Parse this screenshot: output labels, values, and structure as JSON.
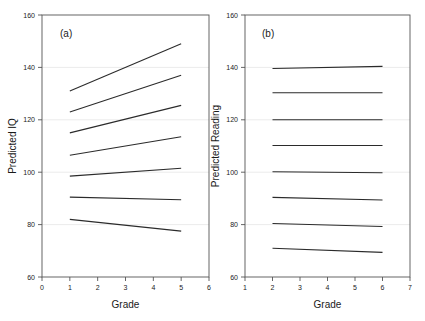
{
  "figure": {
    "background_color": "#ffffff",
    "line_color": "#2b2b2b",
    "axis_color": "#555555",
    "grid_color": "#e2e2e2"
  },
  "chart_data": [
    {
      "type": "line",
      "panel_label": "(a)",
      "title": "",
      "xlabel": "Grade",
      "ylabel": "Predicted IQ",
      "xlim": [
        0,
        6
      ],
      "ylim": [
        60,
        160
      ],
      "xticks": [
        0,
        1,
        2,
        3,
        4,
        5,
        6
      ],
      "xtick_labels": [
        "0",
        "1",
        "2",
        "3",
        "4",
        "5",
        "6"
      ],
      "yticks": [
        60,
        80,
        100,
        120,
        140,
        160
      ],
      "ytick_labels": [
        "60",
        "80",
        "100",
        "120",
        "140",
        "160"
      ],
      "grid": true,
      "legend": "none",
      "x": [
        1,
        5
      ],
      "series": [
        {
          "name": "line-1",
          "values": [
            131.0,
            149.0
          ]
        },
        {
          "name": "line-2",
          "values": [
            123.0,
            137.0
          ]
        },
        {
          "name": "line-3",
          "values": [
            115.0,
            125.5
          ]
        },
        {
          "name": "line-4",
          "values": [
            106.5,
            113.5
          ]
        },
        {
          "name": "line-5",
          "values": [
            98.5,
            101.5
          ]
        },
        {
          "name": "line-6",
          "values": [
            90.5,
            89.5
          ]
        },
        {
          "name": "line-7",
          "values": [
            82.0,
            77.5
          ]
        }
      ]
    },
    {
      "type": "line",
      "panel_label": "(b)",
      "title": "",
      "xlabel": "Grade",
      "ylabel": "Predicted Reading",
      "xlim": [
        1,
        7
      ],
      "ylim": [
        60,
        160
      ],
      "xticks": [
        1,
        2,
        3,
        4,
        5,
        6,
        7
      ],
      "xtick_labels": [
        "1",
        "2",
        "3",
        "4",
        "5",
        "6",
        "7"
      ],
      "yticks": [
        60,
        80,
        100,
        120,
        140,
        160
      ],
      "ytick_labels": [
        "60",
        "80",
        "100",
        "120",
        "140",
        "160"
      ],
      "grid": true,
      "legend": "none",
      "x": [
        2,
        6
      ],
      "series": [
        {
          "name": "line-1",
          "values": [
            139.6,
            140.4
          ]
        },
        {
          "name": "line-2",
          "values": [
            130.3,
            130.3
          ]
        },
        {
          "name": "line-3",
          "values": [
            120.0,
            120.0
          ]
        },
        {
          "name": "line-4",
          "values": [
            110.2,
            110.2
          ]
        },
        {
          "name": "line-5",
          "values": [
            100.2,
            99.8
          ]
        },
        {
          "name": "line-6",
          "values": [
            90.4,
            89.4
          ]
        },
        {
          "name": "line-7",
          "values": [
            80.4,
            79.3
          ]
        },
        {
          "name": "line-8",
          "values": [
            71.0,
            69.4
          ]
        }
      ]
    }
  ]
}
